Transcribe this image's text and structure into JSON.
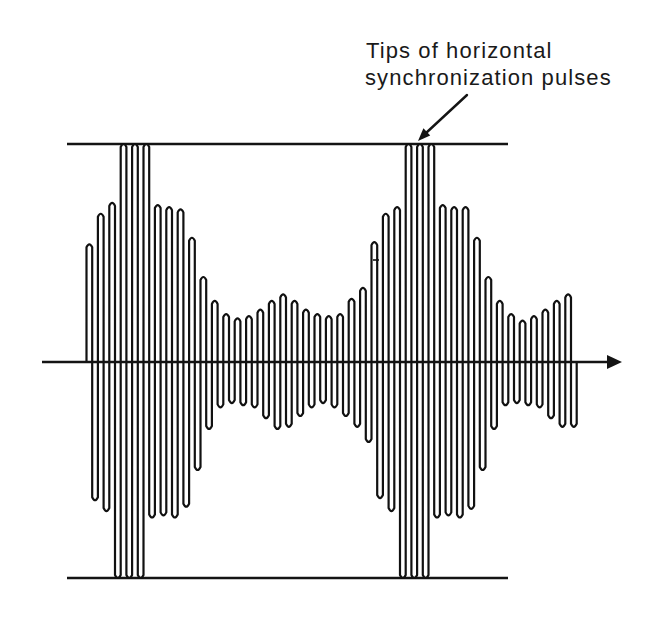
{
  "diagram": {
    "annotation": {
      "line1": "Tips of horizontal",
      "line2": "synchronization pulses"
    },
    "waveform": {
      "peak_amplitudes": [
        0.54,
        0.68,
        0.73,
        1.0,
        1.0,
        1.0,
        0.72,
        0.71,
        0.7,
        0.57,
        0.39,
        0.28,
        0.22,
        0.2,
        0.21,
        0.24,
        0.28,
        0.31,
        0.28,
        0.24,
        0.22,
        0.21,
        0.22,
        0.29,
        0.34,
        0.55,
        0.68,
        0.71,
        1.0,
        1.0,
        1.0,
        0.72,
        0.71,
        0.71,
        0.57,
        0.39,
        0.28,
        0.22,
        0.19,
        0.21,
        0.24,
        0.28,
        0.31
      ],
      "trough_amplitudes": [
        0.64,
        0.69,
        1.0,
        1.0,
        1.0,
        0.72,
        0.71,
        0.72,
        0.67,
        0.5,
        0.31,
        0.21,
        0.19,
        0.2,
        0.21,
        0.26,
        0.31,
        0.3,
        0.25,
        0.21,
        0.19,
        0.21,
        0.25,
        0.3,
        0.37,
        0.63,
        0.69,
        1.0,
        1.0,
        1.0,
        0.72,
        0.71,
        0.72,
        0.68,
        0.5,
        0.31,
        0.2,
        0.19,
        0.2,
        0.21,
        0.26,
        0.3,
        0.3
      ]
    },
    "colors": {
      "stroke": "#111111",
      "background": "#ffffff"
    }
  }
}
